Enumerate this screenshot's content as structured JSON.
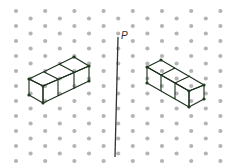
{
  "diagram": {
    "title": "",
    "mirror_line": {
      "label": "P",
      "from": [
        118,
        37
      ],
      "to": [
        115,
        157
      ],
      "color": "#333333"
    },
    "dot_grid": {
      "origin": [
        16,
        11
      ],
      "dx": 14.6,
      "dy": 15,
      "cols": 16,
      "rows": 11,
      "color": "#b4b4b4"
    },
    "colors": {
      "top": "#7fb27a",
      "front": "#2f8a3a",
      "side": "#4a9a4a",
      "light_top": "#a9cfa4",
      "light_front": "#6aae66",
      "light_side": "#8cc288"
    },
    "left_prism": {
      "cubes": 3,
      "orientation": "extends up-right",
      "faces": {
        "top": [
          [
            29,
            79
          ],
          [
            74,
            57
          ],
          [
            89,
            66
          ],
          [
            43,
            86
          ]
        ],
        "front": [
          [
            29,
            79
          ],
          [
            43,
            86
          ],
          [
            43,
            103
          ],
          [
            29,
            95
          ]
        ],
        "side": [
          [
            43,
            86
          ],
          [
            89,
            66
          ],
          [
            89,
            81
          ],
          [
            43,
            103
          ]
        ]
      },
      "dividers_top": [
        [
          [
            44,
            72
          ],
          [
            58,
            79
          ]
        ],
        [
          [
            59,
            64
          ],
          [
            74,
            72
          ]
        ]
      ],
      "dividers_side": [
        [
          [
            58,
            79
          ],
          [
            58,
            96
          ]
        ],
        [
          [
            74,
            72
          ],
          [
            74,
            89
          ]
        ]
      ]
    },
    "right_prism": {
      "cubes": 3,
      "orientation": "extends down-right",
      "faces": {
        "top": [
          [
            147,
            67
          ],
          [
            161,
            60
          ],
          [
            204,
            85
          ],
          [
            189,
            91
          ]
        ],
        "front": [
          [
            189,
            91
          ],
          [
            204,
            85
          ],
          [
            204,
            99
          ],
          [
            189,
            107
          ]
        ],
        "side": [
          [
            147,
            67
          ],
          [
            189,
            91
          ],
          [
            189,
            107
          ],
          [
            147,
            83
          ]
        ]
      },
      "dividers_top": [
        [
          [
            161,
            75
          ],
          [
            175,
            68
          ]
        ],
        [
          [
            175,
            83
          ],
          [
            190,
            76
          ]
        ]
      ],
      "dividers_side": [
        [
          [
            161,
            75
          ],
          [
            161,
            91
          ]
        ],
        [
          [
            175,
            83
          ],
          [
            175,
            99
          ]
        ]
      ]
    }
  }
}
